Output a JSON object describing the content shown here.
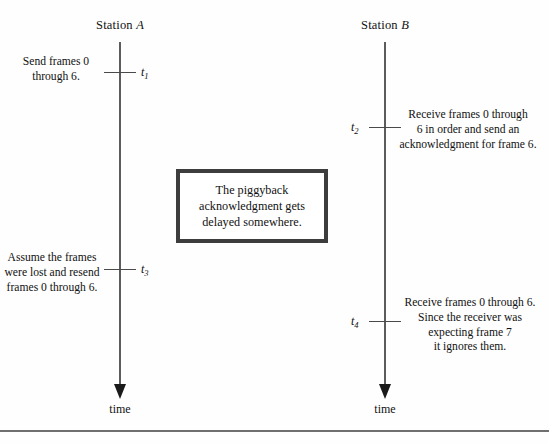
{
  "figure": {
    "background_color": "#fefefe",
    "line_color": "#5c5c5c",
    "box_border_color": "#3d3d3d",
    "rule_color": "#6f6f6f"
  },
  "stations": [
    {
      "name": "station-a",
      "label_prefix": "Station",
      "label_em": "A"
    },
    {
      "name": "station-b",
      "label_prefix": "Station",
      "label_em": "B"
    }
  ],
  "axis_labels": {
    "left_time": "time",
    "right_time": "time"
  },
  "events": [
    {
      "id": "t1",
      "marker": "t",
      "subscript": "1",
      "station": "A",
      "note": "Send frames 0\nthrough 6."
    },
    {
      "id": "t2",
      "marker": "t",
      "subscript": "2",
      "station": "B",
      "note": "Receive frames 0 through\n6 in order and send an\nacknowledgment for frame 6."
    },
    {
      "id": "t3",
      "marker": "t",
      "subscript": "3",
      "station": "A",
      "note": "Assume the frames\nwere lost and resend\nframes 0 through 6."
    },
    {
      "id": "t4",
      "marker": "t",
      "subscript": "4",
      "station": "B",
      "note": "Receive frames 0 through 6.\nSince the receiver was\nexpecting frame 7\nit ignores them."
    }
  ],
  "notes": {
    "t1_note": "Send frames 0 through 6.",
    "t1_line1": "Send frames 0",
    "t1_line2": "through 6.",
    "t2_line1": "Receive frames 0 through",
    "t2_line2": "6 in order and send an",
    "t2_line3": "acknowledgment for frame 6.",
    "t3_line1": "Assume the frames",
    "t3_line2": "were lost and resend",
    "t3_line3": "frames 0 through 6.",
    "t4_line1": "Receive frames 0 through 6.",
    "t4_line2": "Since the receiver was",
    "t4_line3": "expecting frame 7",
    "t4_line4": "it ignores them."
  },
  "callout": {
    "line1": "The piggyback",
    "line2": "acknowledgment gets",
    "line3": "delayed somewhere."
  },
  "labels": {
    "t1": "t",
    "t1_sub": "1",
    "t2": "t",
    "t2_sub": "2",
    "t3": "t",
    "t3_sub": "3",
    "t4": "t",
    "t4_sub": "4"
  }
}
